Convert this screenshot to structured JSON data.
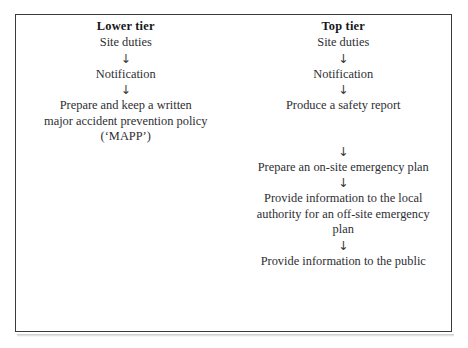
{
  "figure": {
    "type": "two-column-flowchart",
    "border_color": "#3a3a3f",
    "background_color": "#ffffff",
    "text_color": "#2e2e33",
    "arrow_glyph": "↓",
    "columns": [
      {
        "id": "lower-tier",
        "header": "Lower tier",
        "steps": [
          "Site duties",
          "Notification",
          "Prepare and keep a written major accident prevention policy (‘MAPP’)"
        ]
      },
      {
        "id": "top-tier",
        "header": "Top tier",
        "steps": [
          "Site duties",
          "Notification",
          "Produce a safety report",
          "Prepare an on-site emergency plan",
          "Provide information to the local authority for an off-site emergency plan",
          "Provide information to the public"
        ]
      }
    ]
  },
  "left": {
    "header": "Lower tier",
    "step1": "Site duties",
    "arrow1": "↓",
    "step2": "Notification",
    "arrow2": "↓",
    "step3_line1": "Prepare and keep a written",
    "step3_line2": "major accident prevention policy",
    "step3_line3": "(‘MAPP’)"
  },
  "right": {
    "header": "Top tier",
    "step1": "Site duties",
    "arrow1": "↓",
    "step2": "Notification",
    "arrow2": "↓",
    "step3": "Produce a safety report",
    "arrow3": "↓",
    "step4": "Prepare an on-site emergency plan",
    "arrow4": "↓",
    "step5_line1": "Provide information to the local",
    "step5_line2": "authority for an off-site emergency",
    "step5_line3": "plan",
    "arrow5": "↓",
    "step6": "Provide information to the public"
  }
}
